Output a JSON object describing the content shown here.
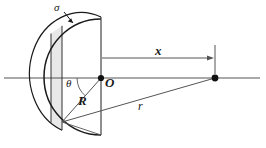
{
  "figure": {
    "kind": "physics-diagram",
    "colors": {
      "stroke": "#1a1a1a",
      "thin_stroke": "#555555",
      "strip_fill": "#e8e8e8",
      "axis": "#555555",
      "background": "#ffffff"
    },
    "labels": {
      "sigma": "σ",
      "theta": "θ",
      "origin": "O",
      "radius": "R",
      "slant": "r",
      "axial_distance": "x"
    },
    "label_meanings": {
      "sigma": "surface charge density",
      "theta": "polar angle measured from the axis at the center",
      "origin": "center of the hemisphere",
      "radius": "hemisphere radius",
      "slant": "distance from ring element to field point",
      "axial_distance": "distance from O to the field point along the axis"
    },
    "geometry": {
      "center": {
        "x": 101,
        "y": 78
      },
      "field_point": {
        "x": 215,
        "y": 78
      },
      "ring_point": {
        "x": 62,
        "y": 122
      },
      "radius_px": 57,
      "arc_top": {
        "x": 101,
        "y": 19
      },
      "arc_bottom": {
        "x": 101,
        "y": 135
      },
      "strip_left": 51,
      "strip_right": 62,
      "axis_y": 78,
      "axis_x_start": 4,
      "axis_x_end": 260,
      "dim_line_y": 58,
      "flat_edge_x": 101
    }
  }
}
